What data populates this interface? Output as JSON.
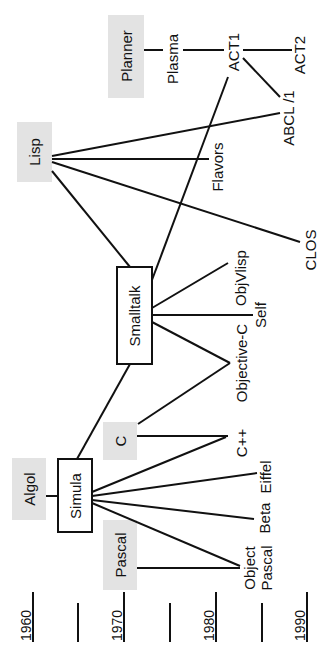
{
  "timeline": {
    "labels": [
      "1960",
      "1970",
      "1980",
      "1990"
    ]
  },
  "nodes": {
    "algol": "Algol",
    "simula": "Simula",
    "pascal": "Pascal",
    "c": "C",
    "smalltalk": "Smalltalk",
    "lisp": "Lisp",
    "planner": "Planner",
    "plasma": "Plasma",
    "act1": "ACT1",
    "act2": "ACT2",
    "abcl1": "ABCL /1",
    "flavors": "Flavors",
    "clos": "CLOS",
    "objvlisp": "ObjVlisp",
    "self": "Self",
    "objective_c": "Objective-C",
    "cpp": "C++",
    "eiffel": "Eiffel",
    "beta": "Beta",
    "object_pascal_1": "Object",
    "object_pascal_2": "Pascal"
  },
  "colors": {
    "line": "#111111",
    "root_box": "#e3e3e3",
    "background": "#ffffff"
  }
}
